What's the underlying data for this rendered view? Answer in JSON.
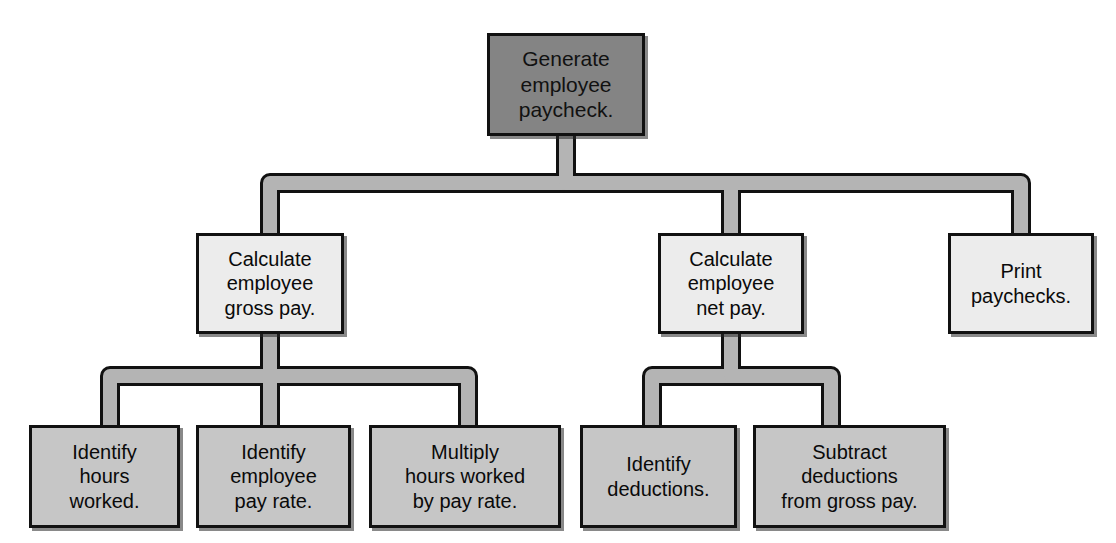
{
  "diagram": {
    "type": "hierarchy-structure-chart",
    "background_color": "#ffffff",
    "connector": {
      "fill_color": "#b4b4b4",
      "stroke_color": "#111111",
      "style": "thick-rounded-pipe"
    },
    "levels": [
      {
        "level": 0,
        "fill_color": "#848484",
        "border_color": "#111111",
        "nodes": [
          {
            "id": "root",
            "label": "Generate\nemployee\npaycheck.",
            "x": 487,
            "y": 33,
            "w": 158,
            "h": 103
          }
        ]
      },
      {
        "level": 1,
        "fill_color": "#ececec",
        "border_color": "#111111",
        "nodes": [
          {
            "id": "gross",
            "label": "Calculate\nemployee\ngross pay.",
            "x": 196,
            "y": 233,
            "w": 148,
            "h": 101
          },
          {
            "id": "net",
            "label": "Calculate\nemployee\nnet pay.",
            "x": 658,
            "y": 233,
            "w": 146,
            "h": 101
          },
          {
            "id": "print",
            "label": "Print\npaychecks.",
            "x": 948,
            "y": 233,
            "w": 146,
            "h": 101
          }
        ]
      },
      {
        "level": 2,
        "fill_color": "#c6c6c6",
        "border_color": "#111111",
        "nodes": [
          {
            "id": "hours",
            "label": "Identify\nhours\nworked.",
            "x": 29,
            "y": 425,
            "w": 151,
            "h": 103
          },
          {
            "id": "payrate",
            "label": "Identify\nemployee\npay rate.",
            "x": 196,
            "y": 425,
            "w": 155,
            "h": 103
          },
          {
            "id": "multiply",
            "label": "Multiply\nhours worked\nby pay rate.",
            "x": 369,
            "y": 425,
            "w": 192,
            "h": 103
          },
          {
            "id": "deductions",
            "label": "Identify\ndeductions.",
            "x": 580,
            "y": 425,
            "w": 157,
            "h": 103
          },
          {
            "id": "subtract",
            "label": "Subtract\ndeductions\nfrom gross pay.",
            "x": 753,
            "y": 425,
            "w": 193,
            "h": 103
          }
        ]
      }
    ],
    "edges": [
      {
        "from": "root",
        "to": "gross"
      },
      {
        "from": "root",
        "to": "net"
      },
      {
        "from": "root",
        "to": "print"
      },
      {
        "from": "gross",
        "to": "hours"
      },
      {
        "from": "gross",
        "to": "payrate"
      },
      {
        "from": "gross",
        "to": "multiply"
      },
      {
        "from": "net",
        "to": "deductions"
      },
      {
        "from": "net",
        "to": "subtract"
      }
    ]
  }
}
